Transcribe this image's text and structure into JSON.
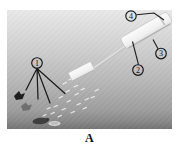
{
  "panel": {
    "label": "A"
  },
  "callouts": [
    {
      "num": "1"
    },
    {
      "num": "2"
    },
    {
      "num": "3"
    },
    {
      "num": "4"
    }
  ],
  "colors": {
    "photo_top": "#e9e9e9",
    "photo_mid": "#bdbdbd",
    "photo_bottom": "#757575",
    "ink": "#1c1c1c",
    "object_white": "#f5f5f5"
  }
}
